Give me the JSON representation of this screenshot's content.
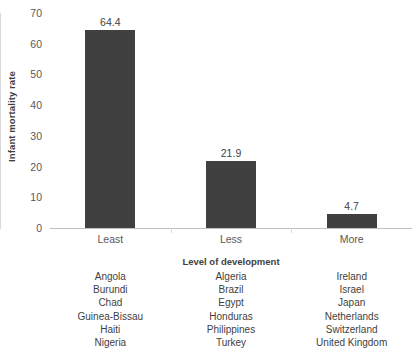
{
  "chart_data": {
    "type": "bar",
    "title": "",
    "subtitle": "",
    "xlabel": "Level of development",
    "ylabel": "Infant mortality rate",
    "categories": [
      "Least",
      "Less",
      "More"
    ],
    "values": [
      64.4,
      21.9,
      4.7
    ],
    "value_labels": [
      "64.4",
      "21.9",
      "4.7"
    ],
    "ylim": [
      0,
      70
    ],
    "yticks": [
      0,
      10,
      20,
      30,
      40,
      50,
      60,
      70
    ],
    "ytick_labels": [
      "0",
      "10",
      "20",
      "30",
      "40",
      "50",
      "60",
      "70"
    ],
    "grid": false,
    "legend": "none",
    "bar_color": "#404040",
    "axis_color": "#d9d9d9",
    "text_color": "#3f3f3f",
    "groups": [
      {
        "category": "Least",
        "value": 64.4,
        "countries": [
          "Angola",
          "Burundi",
          "Chad",
          "Guinea-Bissau",
          "Haiti",
          "Nigeria"
        ]
      },
      {
        "category": "Less",
        "value": 21.9,
        "countries": [
          "Algeria",
          "Brazil",
          "Egypt",
          "Honduras",
          "Philippines",
          "Turkey"
        ]
      },
      {
        "category": "More",
        "value": 4.7,
        "countries": [
          "Ireland",
          "Israel",
          "Japan",
          "Netherlands",
          "Switzerland",
          "United Kingdom"
        ]
      }
    ]
  }
}
